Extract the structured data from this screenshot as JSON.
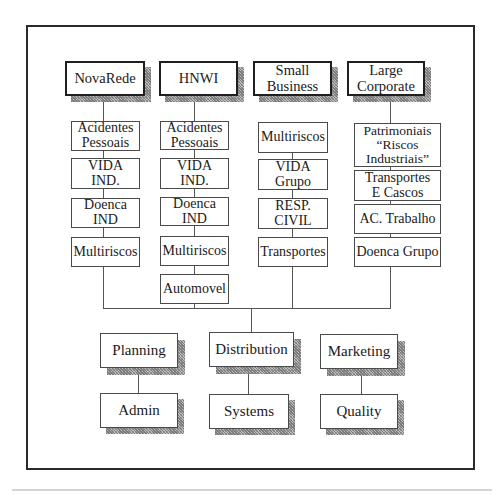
{
  "diagram": {
    "segments": [
      {
        "name": "NovaRede",
        "products": [
          "Acidentes\nPessoais",
          "VIDA\nIND.",
          "Doenca\nIND",
          "Multiriscos"
        ]
      },
      {
        "name": "HNWI",
        "products": [
          "Acidentes\nPessoais",
          "VIDA\nIND.",
          "Doenca\nIND",
          "Multiriscos",
          "Automovel"
        ]
      },
      {
        "name": "Small\nBusiness",
        "products": [
          "Multiriscos",
          "VIDA\nGrupo",
          "RESP.\nCIVIL",
          "Transportes"
        ]
      },
      {
        "name": "Large\nCorporate",
        "products": [
          "Patrimoniais\n“Riscos\nIndustriais”",
          "Transportes\nE Cascos",
          "AC. Trabalho",
          "Doenca Grupo"
        ]
      }
    ],
    "functions": [
      {
        "name": "Planning",
        "sub": "Admin"
      },
      {
        "name": "Distribution",
        "sub": "Systems"
      },
      {
        "name": "Marketing",
        "sub": "Quality"
      }
    ]
  }
}
